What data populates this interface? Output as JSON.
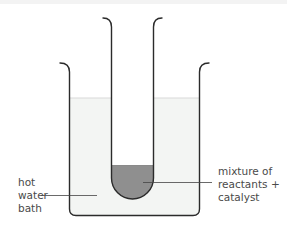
{
  "diagram": {
    "type": "lab-apparatus",
    "components": [
      "beaker",
      "test-tube",
      "water",
      "reaction-mixture"
    ],
    "colors": {
      "glass_outline": "#2b2b2b",
      "water_fill": "#f3f5f3",
      "water_surface": "#dcdcdc",
      "mixture_fill": "#8f8f8f",
      "leader_line": "#444444",
      "label_text": "#4a4a4a"
    }
  },
  "labels": {
    "water_bath": {
      "lines": [
        "hot",
        "water",
        "bath"
      ]
    },
    "mixture": {
      "lines": [
        "mixture of",
        "reactants +",
        "catalyst"
      ]
    }
  }
}
